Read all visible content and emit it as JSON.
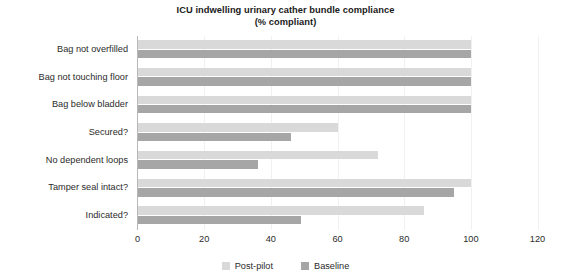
{
  "chart_data": {
    "type": "bar",
    "orientation": "horizontal",
    "title": "ICU indwelling urinary cather bundle compliance",
    "subtitle": "(% compliant)",
    "xlabel": "",
    "ylabel": "",
    "xlim": [
      0,
      120
    ],
    "xticks": [
      0,
      20,
      40,
      60,
      80,
      100,
      120
    ],
    "xtick_labels": [
      "0",
      "20",
      "40",
      "60",
      "80",
      "100",
      "120"
    ],
    "grid": false,
    "legend_position": "bottom",
    "categories": [
      "Bag not overfilled",
      "Bag not touching floor",
      "Bag below bladder",
      "Secured?",
      "No dependent loops",
      "Tamper seal intact?",
      "Indicated?"
    ],
    "series": [
      {
        "name": "Post-pilot",
        "color": "#d9d9d9",
        "values": [
          100,
          100,
          100,
          60,
          72,
          100,
          86
        ]
      },
      {
        "name": "Baseline",
        "color": "#a6a6a6",
        "values": [
          100,
          100,
          100,
          46,
          36,
          95,
          49
        ]
      }
    ]
  },
  "legend": {
    "entries": [
      {
        "label": "Post-pilot",
        "color": "#d9d9d9"
      },
      {
        "label": "Baseline",
        "color": "#a6a6a6"
      }
    ]
  },
  "axis": {
    "line_color": "#b8b8b8"
  }
}
